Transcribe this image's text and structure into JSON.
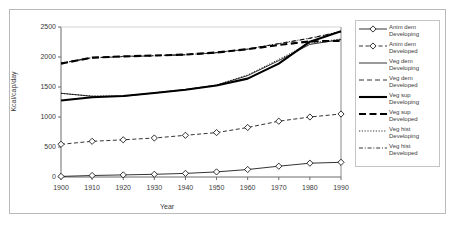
{
  "chart_data": {
    "type": "line",
    "title": "",
    "xlabel": "Year",
    "ylabel": "Kcal/cap/day",
    "xlim": [
      1900,
      1990
    ],
    "ylim": [
      0,
      2500
    ],
    "yticks": [
      0,
      500,
      1000,
      1500,
      2000,
      2500
    ],
    "grid": false,
    "legend_position": "right",
    "x": [
      1900,
      1910,
      1920,
      1930,
      1940,
      1950,
      1960,
      1970,
      1980,
      1990
    ],
    "series": [
      {
        "name": "Anim dem Developing",
        "style": "solid-thin-diamond",
        "values": [
          10,
          25,
          35,
          45,
          60,
          85,
          125,
          180,
          230,
          245
        ]
      },
      {
        "name": "Anim dem Developed",
        "style": "dashed-thin-diamond",
        "values": [
          545,
          595,
          620,
          650,
          695,
          740,
          825,
          930,
          1000,
          1050
        ]
      },
      {
        "name": "Veg dem Developing",
        "style": "solid-thin",
        "values": [
          1395,
          1345,
          1345,
          1400,
          1455,
          1530,
          1690,
          1940,
          2210,
          2290
        ]
      },
      {
        "name": "Veg dem Developed",
        "style": "dashed-thin",
        "values": [
          1895,
          1985,
          2005,
          2020,
          2035,
          2070,
          2130,
          2220,
          2310,
          2420
        ]
      },
      {
        "name": "Veg sup Developing",
        "style": "solid-thick",
        "values": [
          1275,
          1330,
          1350,
          1400,
          1455,
          1525,
          1640,
          1890,
          2255,
          2430
        ]
      },
      {
        "name": "Veg sup Developed",
        "style": "dashed-thick",
        "values": [
          1890,
          1990,
          2010,
          2025,
          2040,
          2075,
          2130,
          2200,
          2260,
          2270
        ]
      },
      {
        "name": "Veg hist Developing",
        "style": "dotted-thin",
        "values": [
          1395,
          1350,
          1350,
          1405,
          1460,
          1535,
          1700,
          1960,
          2230,
          2300
        ]
      },
      {
        "name": "Veg hist Developed",
        "style": "dashdot-thin",
        "values": [
          1900,
          1990,
          2010,
          2025,
          2040,
          2075,
          2135,
          2225,
          2315,
          2425
        ]
      }
    ]
  },
  "legend": {
    "entries": [
      {
        "label": "Anim dem\nDeveloping"
      },
      {
        "label": "Anim dem\nDeveloped"
      },
      {
        "label": "Veg dem\nDeveloping"
      },
      {
        "label": "Veg dem\nDeveloped"
      },
      {
        "label": "Veg sup\nDeveloping"
      },
      {
        "label": "Veg sup\nDeveloped"
      },
      {
        "label": "Veg hist\nDeveloping"
      },
      {
        "label": "Veg hist\nDeveloped"
      }
    ]
  },
  "axes": {
    "y_tick_labels": [
      "2500",
      "2000",
      "1500",
      "1000",
      "500",
      "0"
    ],
    "x_tick_labels": [
      "1900",
      "1910",
      "1920",
      "1930",
      "1940",
      "1950",
      "1960",
      "1970",
      "1980",
      "1990"
    ],
    "y_axis_title": "Kcal/cap/day",
    "x_axis_title": "Year"
  },
  "colors": {
    "line": "#000000",
    "axis": "#6b6b6b",
    "frame": "#b9b9b9",
    "text": "#3a3a3a",
    "background": "#ffffff"
  }
}
